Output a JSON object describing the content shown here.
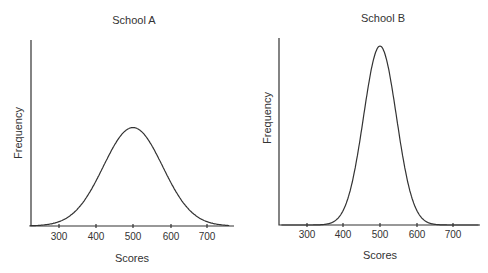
{
  "chart_data": [
    {
      "type": "line",
      "title": "School A",
      "xlabel": "Scores",
      "ylabel": "Frequency",
      "xticks": [
        300,
        400,
        500,
        600,
        700
      ],
      "xlim": [
        220,
        760
      ],
      "distribution": {
        "shape": "normal",
        "mean": 500,
        "sd": 80,
        "relative_peak": 0.55
      },
      "grid": false,
      "legend": null
    },
    {
      "type": "line",
      "title": "School B",
      "xlabel": "Scores",
      "ylabel": "Frequency",
      "xticks": [
        300,
        400,
        500,
        600,
        700
      ],
      "xlim": [
        230,
        770
      ],
      "distribution": {
        "shape": "normal",
        "mean": 500,
        "sd": 45,
        "relative_peak": 1.0
      },
      "grid": false,
      "legend": null
    }
  ],
  "charts": [
    {
      "title": "School A",
      "xlabel": "Scores",
      "ylabel": "Frequency",
      "ticks": [
        "300",
        "400",
        "500",
        "600",
        "700"
      ]
    },
    {
      "title": "School B",
      "xlabel": "Scores",
      "ylabel": "Frequency",
      "ticks": [
        "300",
        "400",
        "500",
        "600",
        "700"
      ]
    }
  ]
}
